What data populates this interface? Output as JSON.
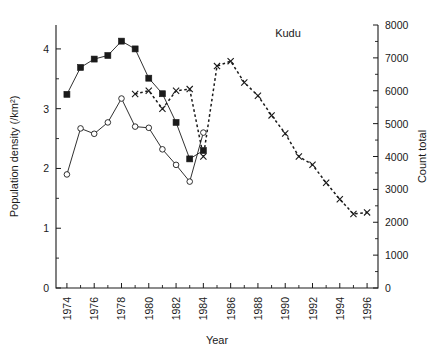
{
  "chart_data": {
    "type": "line",
    "title": "Kudu",
    "xlabel": "Year",
    "ylabel": "Population density (/km²)",
    "y2label": "Count total",
    "xlim": [
      1973.2,
      1996.8
    ],
    "ylim": [
      0,
      4.4
    ],
    "y2lim": [
      0,
      8000
    ],
    "grid": false,
    "legend_position": "none",
    "x_ticks_major": [
      1974,
      1976,
      1978,
      1980,
      1982,
      1984,
      1986,
      1988,
      1990,
      1992,
      1994,
      1996
    ],
    "x_ticks_minor": [
      1975,
      1977,
      1979,
      1981,
      1983,
      1985,
      1987,
      1989,
      1991,
      1993,
      1995
    ],
    "y_ticks_major": [
      0,
      1,
      2,
      3,
      4
    ],
    "y_ticks_minor": [
      0.5,
      1.5,
      2.5,
      3.5
    ],
    "y2_ticks_major": [
      0,
      1000,
      2000,
      3000,
      4000,
      5000,
      6000,
      7000,
      8000
    ],
    "y2_ticks_minor": [
      500,
      1500,
      2500,
      3500,
      4500,
      5500,
      6500,
      7500
    ],
    "series": [
      {
        "name": "Population density (filled squares)",
        "marker": "filled-square",
        "linestyle": "solid",
        "axis": "left",
        "x": [
          1974,
          1975,
          1976,
          1977,
          1978,
          1979,
          1980,
          1981,
          1982,
          1983,
          1984
        ],
        "values": [
          3.24,
          3.69,
          3.83,
          3.89,
          4.13,
          4.0,
          3.51,
          3.25,
          2.77,
          2.16,
          2.3
        ]
      },
      {
        "name": "Population density (open circles)",
        "marker": "open-circle",
        "linestyle": "solid",
        "axis": "left",
        "x": [
          1974,
          1975,
          1976,
          1977,
          1978,
          1979,
          1980,
          1981,
          1982,
          1983,
          1984
        ],
        "values": [
          1.9,
          2.67,
          2.58,
          2.77,
          3.17,
          2.7,
          2.68,
          2.32,
          2.06,
          1.78,
          2.6
        ]
      },
      {
        "name": "Count total (crosses)",
        "marker": "x",
        "linestyle": "dashed",
        "axis": "right",
        "x": [
          1979,
          1980,
          1981,
          1982,
          1983,
          1984,
          1985,
          1986,
          1987,
          1988,
          1989,
          1990,
          1991,
          1992,
          1993,
          1994,
          1995,
          1996
        ],
        "values": [
          5900,
          6000,
          5450,
          6000,
          6050,
          4000,
          6750,
          6900,
          6250,
          5850,
          5250,
          4700,
          4000,
          3750,
          3200,
          2700,
          2250,
          2300
        ]
      }
    ]
  },
  "axis_labels": {
    "x_tick_1974": "1974",
    "x_tick_1976": "1976",
    "x_tick_1978": "1978",
    "x_tick_1980": "1980",
    "x_tick_1982": "1982",
    "x_tick_1984": "1984",
    "x_tick_1986": "1986",
    "x_tick_1988": "1988",
    "x_tick_1990": "1990",
    "x_tick_1992": "1992",
    "x_tick_1994": "1994",
    "x_tick_1996": "1996",
    "y_tick_0": "0",
    "y_tick_1": "1",
    "y_tick_2": "2",
    "y_tick_3": "3",
    "y_tick_4": "4",
    "y2_tick_0": "0",
    "y2_tick_1000": "1000",
    "y2_tick_2000": "2000",
    "y2_tick_3000": "3000",
    "y2_tick_4000": "4000",
    "y2_tick_5000": "5000",
    "y2_tick_6000": "6000",
    "y2_tick_7000": "7000",
    "y2_tick_8000": "8000"
  },
  "colors": {
    "ink": "#1a1a1a",
    "background": "#ffffff"
  }
}
